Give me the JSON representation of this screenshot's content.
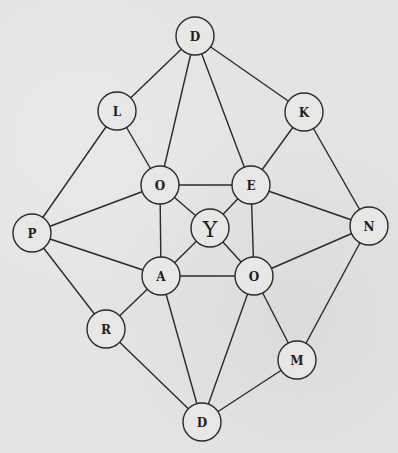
{
  "diagram": {
    "type": "undirected-graph",
    "colors": {
      "background": "#e4e4e2",
      "node_fill": "#e7e7e5",
      "stroke": "#2a2a2a",
      "text": "#1e1e1e"
    },
    "nodes": [
      {
        "id": "d_top",
        "label": "D",
        "x": 195,
        "y": 36,
        "r": 19
      },
      {
        "id": "l",
        "label": "L",
        "x": 117,
        "y": 111,
        "r": 19
      },
      {
        "id": "k",
        "label": "K",
        "x": 304,
        "y": 112,
        "r": 19
      },
      {
        "id": "o_upper",
        "label": "O",
        "x": 160,
        "y": 185,
        "r": 19
      },
      {
        "id": "e",
        "label": "E",
        "x": 251,
        "y": 185,
        "r": 19
      },
      {
        "id": "y",
        "label": "Y",
        "x": 210,
        "y": 228,
        "r": 19
      },
      {
        "id": "p",
        "label": "P",
        "x": 32,
        "y": 233,
        "r": 19
      },
      {
        "id": "n",
        "label": "N",
        "x": 369,
        "y": 226,
        "r": 19
      },
      {
        "id": "a",
        "label": "A",
        "x": 161,
        "y": 276,
        "r": 19
      },
      {
        "id": "o_lower",
        "label": "O",
        "x": 254,
        "y": 276,
        "r": 19
      },
      {
        "id": "r",
        "label": "R",
        "x": 106,
        "y": 329,
        "r": 19
      },
      {
        "id": "m",
        "label": "M",
        "x": 297,
        "y": 360,
        "r": 19
      },
      {
        "id": "d_bottom",
        "label": "D",
        "x": 202,
        "y": 422,
        "r": 19
      }
    ],
    "edges": [
      [
        "d_top",
        "l"
      ],
      [
        "d_top",
        "o_upper"
      ],
      [
        "d_top",
        "e"
      ],
      [
        "d_top",
        "k"
      ],
      [
        "l",
        "o_upper"
      ],
      [
        "l",
        "p"
      ],
      [
        "k",
        "e"
      ],
      [
        "k",
        "n"
      ],
      [
        "o_upper",
        "e"
      ],
      [
        "o_upper",
        "y"
      ],
      [
        "o_upper",
        "p"
      ],
      [
        "o_upper",
        "a"
      ],
      [
        "e",
        "y"
      ],
      [
        "e",
        "n"
      ],
      [
        "e",
        "o_lower"
      ],
      [
        "y",
        "a"
      ],
      [
        "y",
        "o_lower"
      ],
      [
        "p",
        "a"
      ],
      [
        "p",
        "r"
      ],
      [
        "n",
        "o_lower"
      ],
      [
        "n",
        "m"
      ],
      [
        "a",
        "o_lower"
      ],
      [
        "a",
        "r"
      ],
      [
        "a",
        "d_bottom"
      ],
      [
        "o_lower",
        "m"
      ],
      [
        "o_lower",
        "d_bottom"
      ],
      [
        "r",
        "d_bottom"
      ],
      [
        "m",
        "d_bottom"
      ]
    ]
  }
}
